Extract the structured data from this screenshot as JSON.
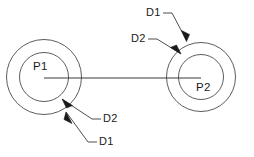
{
  "drawing": {
    "type": "technical-diagram",
    "description": "Two concentric-circle pulleys joined by a horizontal centre line",
    "background_color": "#ffffff",
    "line_color": "#3a3a3a",
    "text_color": "#1a1a1a"
  },
  "shapes": {
    "left_assembly": {
      "center_label": "P1",
      "center": {
        "x": 44,
        "y": 77
      },
      "outer_circle": {
        "cx": 44,
        "cy": 77,
        "r": 37.5,
        "label": "D1"
      },
      "inner_circle": {
        "cx": 44,
        "cy": 77,
        "r": 24.5,
        "label": "D2"
      }
    },
    "right_assembly": {
      "center_label": "P2",
      "center": {
        "x": 201,
        "y": 77
      },
      "outer_circle": {
        "cx": 201,
        "cy": 77,
        "r": 34.5,
        "label": "D1"
      },
      "inner_circle": {
        "cx": 201,
        "cy": 77,
        "r": 22.5,
        "label": "D2"
      }
    },
    "center_line": {
      "x1": 44,
      "y1": 78,
      "x2": 201,
      "y2": 78
    }
  },
  "labels": {
    "top_d1": "D1",
    "top_d2": "D2",
    "bottom_d2": "D2",
    "bottom_d1": "D1",
    "left_center": "P1",
    "right_center": "P2"
  },
  "leaders": [
    {
      "name": "top-d1-leader",
      "label": "D1",
      "text_anchor": {
        "x": 147,
        "y": 13
      },
      "elbow": {
        "x": 172,
        "y": 13
      },
      "arrow_tip": {
        "x": 186,
        "y": 41
      },
      "target": "right outer circle"
    },
    {
      "name": "top-d2-leader",
      "label": "D2",
      "text_anchor": {
        "x": 132,
        "y": 39
      },
      "elbow": {
        "x": 157,
        "y": 39
      },
      "arrow_tip": {
        "x": 180,
        "y": 54
      },
      "target": "right inner circle"
    },
    {
      "name": "bottom-d2-leader",
      "label": "D2",
      "text_anchor": {
        "x": 104,
        "y": 119
      },
      "elbow": {
        "x": 92,
        "y": 119
      },
      "arrow_tip": {
        "x": 62,
        "y": 99
      },
      "target": "left inner circle"
    },
    {
      "name": "bottom-d1-leader",
      "label": "D1",
      "text_anchor": {
        "x": 100,
        "y": 142
      },
      "elbow": {
        "x": 88,
        "y": 142
      },
      "arrow_tip": {
        "x": 66,
        "y": 112
      },
      "target": "left outer circle"
    }
  ]
}
